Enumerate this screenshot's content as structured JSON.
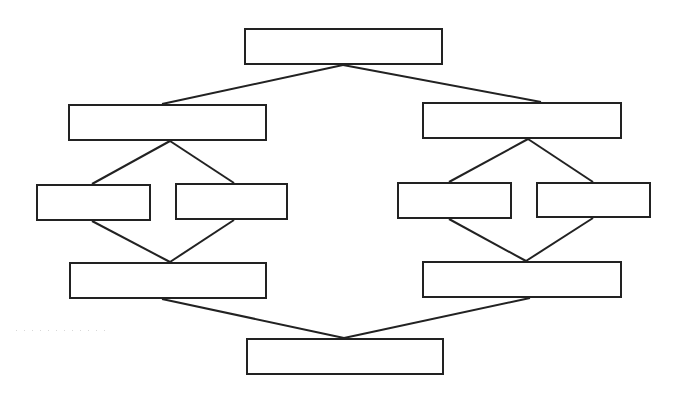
{
  "diagram": {
    "type": "flowchart",
    "colors": {
      "stroke": "#222222",
      "fill": "#ffffff",
      "background": "#ffffff"
    },
    "nodes": [
      {
        "id": "root",
        "label": ""
      },
      {
        "id": "left-branch",
        "label": ""
      },
      {
        "id": "left-branch-a",
        "label": ""
      },
      {
        "id": "left-branch-b",
        "label": ""
      },
      {
        "id": "left-merge",
        "label": ""
      },
      {
        "id": "right-branch",
        "label": ""
      },
      {
        "id": "right-branch-a",
        "label": ""
      },
      {
        "id": "right-branch-b",
        "label": ""
      },
      {
        "id": "right-merge",
        "label": ""
      },
      {
        "id": "final",
        "label": ""
      }
    ],
    "edges": [
      {
        "from": "root",
        "to": "left-branch"
      },
      {
        "from": "root",
        "to": "right-branch"
      },
      {
        "from": "left-branch",
        "to": "left-branch-a"
      },
      {
        "from": "left-branch",
        "to": "left-branch-b"
      },
      {
        "from": "left-branch-a",
        "to": "left-merge"
      },
      {
        "from": "left-branch-b",
        "to": "left-merge"
      },
      {
        "from": "right-branch",
        "to": "right-branch-a"
      },
      {
        "from": "right-branch",
        "to": "right-branch-b"
      },
      {
        "from": "right-branch-a",
        "to": "right-merge"
      },
      {
        "from": "right-branch-b",
        "to": "right-merge"
      },
      {
        "from": "left-merge",
        "to": "final"
      },
      {
        "from": "right-merge",
        "to": "final"
      }
    ]
  }
}
